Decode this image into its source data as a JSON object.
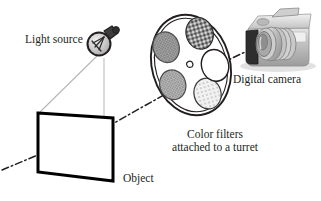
{
  "figure": {
    "background_color": "#ffffff",
    "text_color": "#231f20"
  },
  "labels": {
    "light_source": "Light source",
    "digital_camera": "Digital camera",
    "object": "Object",
    "color_filters_line1": "Color filters",
    "color_filters_line2": "attached to a turret"
  },
  "components": {
    "light_bulb": {
      "name": "light-bulb-icon",
      "fill": "#cfcfcf",
      "stroke": "#231f20",
      "cap_fill": "#3a3a3a",
      "filament": "visible"
    },
    "object_plane": {
      "name": "object-plane",
      "shape": "parallelogram",
      "stroke": "#000000",
      "fill": "#ffffff",
      "stroke_width_px": 3
    },
    "turret": {
      "name": "filter-turret",
      "shape": "ellipse",
      "stroke": "#231f20",
      "fill": "#ffffff",
      "filter_count": 5,
      "center_hole": true,
      "filters": [
        {
          "name": "filter-top-left",
          "shade": "#9a9a9a",
          "pattern": "crosshatch-fine"
        },
        {
          "name": "filter-top-right",
          "shade": "#4a4a4a",
          "pattern": "lattice-diamond"
        },
        {
          "name": "filter-mid-left",
          "shade": "#b5b5b5",
          "pattern": "crosshatch-fine"
        },
        {
          "name": "filter-bottom-center",
          "shade": "#ededed",
          "pattern": "dots-sparse"
        },
        {
          "name": "filter-right-clear",
          "shade": "#ffffff",
          "pattern": "clear"
        }
      ]
    },
    "camera": {
      "name": "digital-camera-illustration",
      "body_fill": "#bdbdbd",
      "top_fill": "#d8d8d8",
      "lens_fill": "#cfcfcf",
      "grip_fill": "#2b2b2b",
      "shadow": "#d3d3d3"
    }
  },
  "lines": {
    "illumination_rays": {
      "name": "illumination-ray",
      "stroke": "#b0b0b0",
      "style": "solid",
      "count": 2
    },
    "optical_axis": {
      "name": "optical-axis-line",
      "stroke": "#231f20",
      "style": "dash-dot",
      "description": "dash-dot ray from object through turret filters into camera lens"
    }
  }
}
